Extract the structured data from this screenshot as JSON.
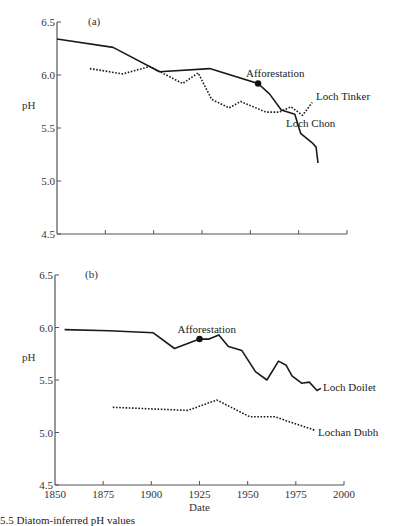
{
  "chart_data": [
    {
      "type": "line",
      "panel_label": "(a)",
      "title": "",
      "xlabel": "",
      "ylabel": "pH",
      "xlim": [
        1850,
        2000
      ],
      "ylim": [
        4.5,
        6.5
      ],
      "yticks": [
        "6.5",
        "6.0",
        "5.5",
        "5.0",
        "4.5"
      ],
      "xticks": [
        1850,
        1875,
        1900,
        1925,
        1950,
        1975,
        2000
      ],
      "show_xtick_labels": false,
      "grid": false,
      "annotations": [
        {
          "text": "Afforestation",
          "x": 1954,
          "y": 5.92,
          "series": "Loch Chon"
        }
      ],
      "series": [
        {
          "name": "Loch Chon",
          "style": "solid",
          "x": [
            1850,
            1879,
            1903,
            1929,
            1954,
            1960,
            1966,
            1973,
            1976,
            1982,
            1984,
            1985
          ],
          "values": [
            6.34,
            6.26,
            6.03,
            6.06,
            5.92,
            5.82,
            5.67,
            5.63,
            5.45,
            5.36,
            5.32,
            5.17
          ]
        },
        {
          "name": "Loch Tinker",
          "style": "dotted",
          "x": [
            1867,
            1884,
            1898,
            1915,
            1923,
            1930,
            1939,
            1945,
            1958,
            1965,
            1971,
            1977,
            1982
          ],
          "values": [
            6.06,
            6.01,
            6.08,
            5.92,
            6.02,
            5.77,
            5.69,
            5.75,
            5.65,
            5.65,
            5.7,
            5.62,
            5.74
          ]
        }
      ]
    },
    {
      "type": "line",
      "panel_label": "(b)",
      "title": "",
      "xlabel": "Date",
      "ylabel": "pH",
      "xlim": [
        1850,
        2000
      ],
      "ylim": [
        4.5,
        6.5
      ],
      "yticks": [
        "6.5",
        "6.0",
        "5.5",
        "5.0",
        "4.5"
      ],
      "xticks": [
        1850,
        1875,
        1900,
        1925,
        1950,
        1975,
        2000
      ],
      "show_xtick_labels": true,
      "grid": false,
      "annotations": [
        {
          "text": "Afforestation",
          "x": 1925,
          "y": 5.89,
          "series": "Loch Doilet"
        }
      ],
      "series": [
        {
          "name": "Loch Doilet",
          "style": "solid",
          "x": [
            1855,
            1878,
            1901,
            1912,
            1925,
            1930,
            1935,
            1940,
            1947,
            1954,
            1960,
            1966,
            1970,
            1973,
            1978,
            1982,
            1986,
            1988
          ],
          "values": [
            5.98,
            5.97,
            5.95,
            5.8,
            5.89,
            5.89,
            5.93,
            5.82,
            5.78,
            5.58,
            5.5,
            5.68,
            5.64,
            5.54,
            5.47,
            5.48,
            5.4,
            5.42
          ]
        },
        {
          "name": "Lochan Dubh",
          "style": "dotted",
          "x": [
            1880,
            1919,
            1934,
            1951,
            1964,
            1985
          ],
          "values": [
            5.24,
            5.21,
            5.31,
            5.15,
            5.15,
            5.02
          ]
        }
      ]
    }
  ],
  "labels": {
    "panel_a": "(a)",
    "panel_b": "(b)",
    "ylabel": "pH",
    "xlabel": "Date",
    "afforestation": "Afforestation",
    "loch_chon": "Loch Chon",
    "loch_tinker": "Loch Tinker",
    "loch_doilet": "Loch Doilet",
    "lochan_dubh": "Lochan Dubh",
    "caption_fragment": "5.5   Diatom-inferred pH values"
  }
}
